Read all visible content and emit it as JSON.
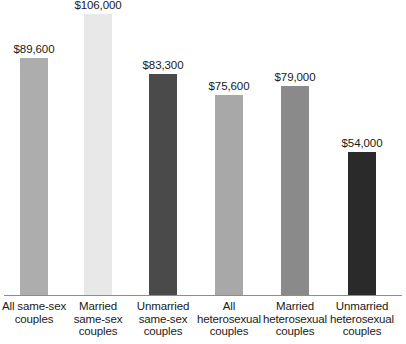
{
  "chart_data": {
    "type": "bar",
    "title": "",
    "subtitle": "",
    "xlabel": "",
    "ylabel": "",
    "ylim": [
      0,
      111000
    ],
    "grid": false,
    "legend": false,
    "axis": {
      "baseline_visible": true,
      "y_axis_visible": false,
      "tick_labels": []
    },
    "categories": [
      "All same-sex couples",
      "Married same-sex couples",
      "Unmarried same-sex couples",
      "All heterosexual couples",
      "Married heterosexual couples",
      "Unmarried heterosexual couples"
    ],
    "values": [
      89600,
      106000,
      83300,
      75600,
      79000,
      54000
    ],
    "value_labels": [
      "$89,600",
      "$106,000",
      "$83,300",
      "$75,600",
      "$79,000",
      "$54,000"
    ],
    "colors": [
      "#adadad",
      "#e8e8e8",
      "#4a4a4a",
      "#a8a8a8",
      "#8a8a8a",
      "#2a2a2a"
    ],
    "bars": [
      {
        "label": "All same-sex couples",
        "label_lines": [
          "All same-sex",
          "couples"
        ],
        "value": 89600,
        "value_label": "$89,600",
        "color": "#adadad"
      },
      {
        "label": "Married same-sex couples",
        "label_lines": [
          "Married",
          "same-sex",
          "couples"
        ],
        "value": 106000,
        "value_label": "$106,000",
        "color": "#e8e8e8"
      },
      {
        "label": "Unmarried same-sex couples",
        "label_lines": [
          "Unmarried",
          "same-sex",
          "couples"
        ],
        "value": 83300,
        "value_label": "$83,300",
        "color": "#4a4a4a"
      },
      {
        "label": "All heterosexual couples",
        "label_lines": [
          "All",
          "heterosexual",
          "couples"
        ],
        "value": 75600,
        "value_label": "$75,600",
        "color": "#a8a8a8"
      },
      {
        "label": "Married heterosexual couples",
        "label_lines": [
          "Married",
          "heterosexual",
          "couples"
        ],
        "value": 79000,
        "value_label": "$79,000",
        "color": "#8a8a8a"
      },
      {
        "label": "Unmarried heterosexual couples",
        "label_lines": [
          "Unmarried",
          "heterosexual",
          "couples"
        ],
        "value": 54000,
        "value_label": "$54,000",
        "color": "#2a2a2a"
      }
    ]
  },
  "style": {
    "background": "#ffffff",
    "text_color": "#1a1a1a",
    "axis_color": "#8d8d8d"
  }
}
